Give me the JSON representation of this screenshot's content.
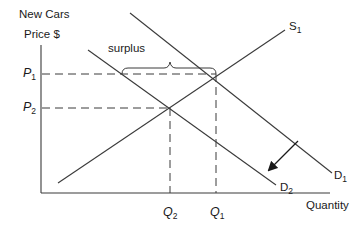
{
  "diagram": {
    "title": "New Cars",
    "y_axis_label": "Price $",
    "x_axis_label": "Quantity",
    "annotation": "surplus",
    "price_labels": [
      {
        "main": "P",
        "sub": "1"
      },
      {
        "main": "P",
        "sub": "2"
      }
    ],
    "quantity_labels": [
      {
        "main": "Q",
        "sub": "2"
      },
      {
        "main": "Q",
        "sub": "1"
      }
    ],
    "curves": [
      {
        "main": "S",
        "sub": "1",
        "type": "supply"
      },
      {
        "main": "D",
        "sub": "1",
        "type": "demand"
      },
      {
        "main": "D",
        "sub": "2",
        "type": "demand"
      }
    ],
    "shift_arrow": "demand shifts from D1 to D2 (leftward/down)",
    "line_color": "#3a3a3a"
  }
}
